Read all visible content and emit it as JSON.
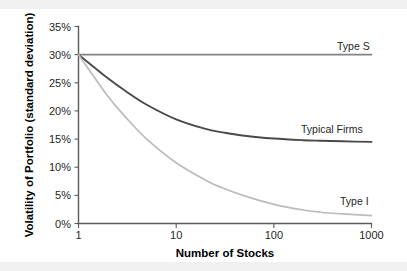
{
  "chart_data": {
    "type": "line",
    "title": "",
    "xlabel": "Number of Stocks",
    "ylabel": "Volatility of Portfolio (standard deviation)",
    "x_scale": "log",
    "xlim": [
      1,
      1000
    ],
    "ylim": [
      0,
      35
    ],
    "x_ticks": [
      1,
      10,
      100,
      1000
    ],
    "x_tick_labels": [
      "1",
      "10",
      "100",
      "1000"
    ],
    "y_ticks": [
      0,
      5,
      10,
      15,
      20,
      25,
      30,
      35
    ],
    "y_tick_labels": [
      "0%",
      "5%",
      "10%",
      "15%",
      "20%",
      "25%",
      "30%",
      "35%"
    ],
    "grid": false,
    "legend_position": "inline-right",
    "series": [
      {
        "name": "Type S",
        "color": "#838383",
        "label_x": 1000,
        "label_y": 31.5,
        "x": [
          1,
          2,
          3,
          5,
          10,
          20,
          30,
          50,
          100,
          200,
          300,
          500,
          1000
        ],
        "values": [
          30.0,
          30.0,
          30.0,
          30.0,
          30.0,
          30.0,
          30.0,
          30.0,
          30.0,
          30.0,
          30.0,
          30.0,
          30.0
        ]
      },
      {
        "name": "Typical Firms",
        "color": "#4a4a4a",
        "label_x": 560,
        "label_y": 16.8,
        "x": [
          1,
          2,
          3,
          5,
          10,
          20,
          30,
          50,
          100,
          200,
          300,
          500,
          1000
        ],
        "values": [
          30.0,
          25.8,
          23.6,
          21.1,
          18.5,
          16.8,
          16.2,
          15.6,
          15.1,
          14.8,
          14.7,
          14.6,
          14.5
        ]
      },
      {
        "name": "Type I",
        "color": "#bcbcbc",
        "label_x": 700,
        "label_y": 3.4,
        "x": [
          1,
          2,
          3,
          5,
          10,
          20,
          30,
          50,
          100,
          200,
          300,
          500,
          1000
        ],
        "values": [
          30.0,
          22.6,
          19.0,
          15.0,
          10.8,
          7.7,
          6.3,
          4.9,
          3.4,
          2.4,
          2.0,
          1.7,
          1.4
        ]
      }
    ]
  },
  "axes": {
    "y_title": "Volatility of Portfolio (standard deviation)",
    "x_title": "Number of Stocks"
  },
  "y_tick_labels": {
    "t0": "0%",
    "t5": "5%",
    "t10": "10%",
    "t15": "15%",
    "t20": "20%",
    "t25": "25%",
    "t30": "30%",
    "t35": "35%"
  },
  "x_tick_labels": {
    "t1": "1",
    "t10": "10",
    "t100": "100",
    "t1000": "1000"
  },
  "series_labels": {
    "type_s": "Type S",
    "typical_firms": "Typical Firms",
    "type_i": "Type I"
  },
  "colors": {
    "type_s": "#838383",
    "typical_firms": "#4a4a4a",
    "type_i": "#bcbcbc",
    "axis": "#5a5a5a",
    "background": "#ffffff",
    "text": "#1a1a1a"
  }
}
